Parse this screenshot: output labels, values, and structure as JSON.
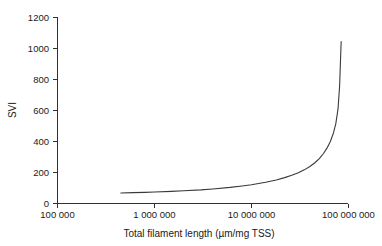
{
  "chart_data": {
    "type": "line",
    "title": "",
    "xlabel": "Total filament length (µm/mg TSS)",
    "ylabel": "SVI",
    "xscale": "log",
    "yscale": "linear",
    "xlim": [
      100000,
      100000000
    ],
    "ylim": [
      0,
      1200
    ],
    "grid": false,
    "legend": null,
    "xticks": [
      100000,
      1000000,
      10000000,
      100000000
    ],
    "xticklabels": [
      "100 000",
      "1 000 000",
      "10 000 000",
      "100 000 000"
    ],
    "yticks": [
      0,
      200,
      400,
      600,
      800,
      1000,
      1200
    ],
    "yticklabels": [
      "0",
      "200",
      "400",
      "600",
      "800",
      "1000",
      "1200"
    ],
    "series": [
      {
        "name": "SVI vs total filament length",
        "color": "#3a3a3a",
        "x": [
          450000,
          600000,
          800000,
          1000000,
          1500000,
          2000000,
          3000000,
          4000000,
          6000000,
          8000000,
          10000000,
          14000000,
          18000000,
          22000000,
          26000000,
          30000000,
          35000000,
          40000000,
          45000000,
          50000000,
          55000000,
          60000000,
          65000000,
          70000000,
          74000000,
          78000000,
          81000000,
          84000000
        ],
        "y": [
          68,
          70,
          72,
          74,
          78,
          82,
          88,
          94,
          104,
          113,
          121,
          137,
          152,
          167,
          182,
          197,
          217,
          239,
          263,
          290,
          321,
          357,
          400,
          455,
          515,
          610,
          760,
          1045
        ]
      }
    ],
    "annotations": []
  },
  "axes": {
    "y_axis_title": "SVI",
    "x_axis_title": "Total filament length (µm/mg TSS)"
  },
  "colors": {
    "curve": "#3a3a3a",
    "axis": "#303030",
    "text": "#1a1a1a",
    "background": "#ffffff"
  }
}
